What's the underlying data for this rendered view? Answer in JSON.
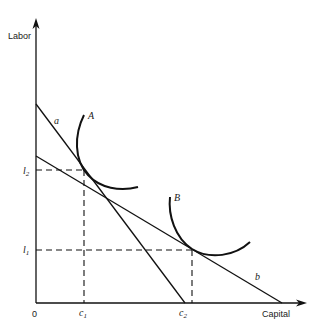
{
  "diagram": {
    "type": "isoquant-isocost",
    "axes": {
      "y_label": "Labor",
      "x_label": "Capital",
      "origin_label": "0"
    },
    "isoquants": [
      {
        "label": "A"
      },
      {
        "label": "B"
      }
    ],
    "isocost_lines": [
      {
        "label": "a"
      },
      {
        "label": "b"
      }
    ],
    "y_ticks": [
      {
        "label": "l",
        "sub": "2"
      },
      {
        "label": "l",
        "sub": "1"
      }
    ],
    "x_ticks": [
      {
        "label": "c",
        "sub": "1"
      },
      {
        "label": "c",
        "sub": "2"
      }
    ]
  }
}
